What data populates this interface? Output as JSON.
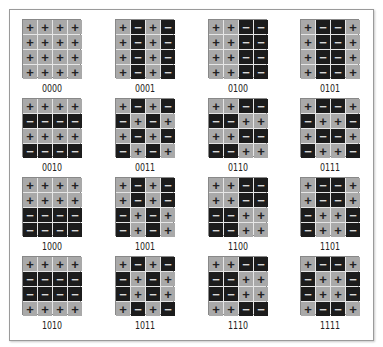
{
  "diagram": {
    "title": "",
    "colors": {
      "plus_cell": "#a9a9a9",
      "minus_cell": "#1c1c1c",
      "frame": "#9a9a9a"
    },
    "symbols": {
      "plus": "+",
      "minus": "−"
    },
    "patterns": [
      {
        "label": "0000",
        "rows": [
          "++++",
          "++++",
          "++++",
          "++++"
        ]
      },
      {
        "label": "0001",
        "rows": [
          "+-+-",
          "+-+-",
          "+-+-",
          "+-+-"
        ]
      },
      {
        "label": "0100",
        "rows": [
          "++--",
          "++--",
          "++--",
          "++--"
        ]
      },
      {
        "label": "0101",
        "rows": [
          "+--+",
          "+--+",
          "+--+",
          "+--+"
        ]
      },
      {
        "label": "0010",
        "rows": [
          "++++",
          "----",
          "++++",
          "----"
        ]
      },
      {
        "label": "0011",
        "rows": [
          "+-+-",
          "-+-+",
          "+-+-",
          "-+-+"
        ]
      },
      {
        "label": "0110",
        "rows": [
          "++--",
          "--++",
          "++--",
          "--++"
        ]
      },
      {
        "label": "0111",
        "rows": [
          "+--+",
          "-++-",
          "+--+",
          "-++-"
        ]
      },
      {
        "label": "1000",
        "rows": [
          "++++",
          "++++",
          "----",
          "----"
        ]
      },
      {
        "label": "1001",
        "rows": [
          "+-+-",
          "+-+-",
          "-+-+",
          "-+-+"
        ]
      },
      {
        "label": "1100",
        "rows": [
          "++--",
          "++--",
          "--++",
          "--++"
        ]
      },
      {
        "label": "1101",
        "rows": [
          "+--+",
          "+--+",
          "-++-",
          "-++-"
        ]
      },
      {
        "label": "1010",
        "rows": [
          "++++",
          "----",
          "----",
          "++++"
        ]
      },
      {
        "label": "1011",
        "rows": [
          "+-+-",
          "-+-+",
          "-+-+",
          "+-+-"
        ]
      },
      {
        "label": "1110",
        "rows": [
          "++--",
          "--++",
          "--++",
          "++--"
        ]
      },
      {
        "label": "1111",
        "rows": [
          "+--+",
          "-++-",
          "-++-",
          "+--+"
        ]
      }
    ]
  }
}
